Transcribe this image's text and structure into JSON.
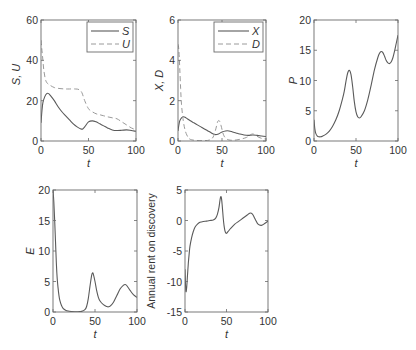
{
  "chart_data": [
    {
      "id": "su",
      "type": "line",
      "title": "",
      "xlabel": "t",
      "ylabel": "S, U",
      "xlim": [
        0,
        100
      ],
      "ylim": [
        0,
        60
      ],
      "xticks": [
        0,
        50,
        100
      ],
      "yticks": [
        0,
        20,
        40,
        60
      ],
      "grid": false,
      "legend_position": "upper right",
      "box": {
        "left": 41,
        "top": 20,
        "right": 136,
        "bottom": 141
      },
      "legend": {
        "left": 87,
        "top": 22,
        "right": 133,
        "bottom": 52
      },
      "series": [
        {
          "name": "S",
          "style": "solid",
          "x": [
            0,
            1,
            2,
            4,
            6,
            8,
            10,
            14,
            18,
            22,
            26,
            30,
            34,
            38,
            42,
            44,
            46,
            50,
            54,
            58,
            62,
            66,
            70,
            75,
            80,
            85,
            90,
            95,
            100
          ],
          "y": [
            9,
            15,
            19,
            22,
            23.5,
            23.5,
            22.5,
            20,
            17,
            14.5,
            12.5,
            10.5,
            8.5,
            7,
            6,
            6,
            7,
            9.5,
            10,
            9.5,
            8.5,
            7.5,
            6.5,
            5.5,
            5.2,
            5.3,
            5.5,
            5.2,
            4.8
          ]
        },
        {
          "name": "U",
          "style": "dashed",
          "x": [
            0,
            1,
            2,
            3,
            5,
            8,
            10,
            14,
            20,
            26,
            30,
            36,
            40,
            43,
            46,
            50,
            54,
            58,
            62,
            66,
            70,
            75,
            80,
            85,
            90,
            95,
            100
          ],
          "y": [
            50,
            45,
            40,
            35,
            30,
            28,
            27.5,
            26.5,
            26,
            25.8,
            25.8,
            25.8,
            25.5,
            24,
            20,
            16,
            14.5,
            13.5,
            13,
            12.5,
            12,
            11.5,
            11,
            9.5,
            8,
            6.5,
            5.5
          ]
        }
      ]
    },
    {
      "id": "xd",
      "type": "line",
      "title": "",
      "xlabel": "t",
      "ylabel": "X, D",
      "xlim": [
        0,
        100
      ],
      "ylim": [
        0,
        6
      ],
      "xticks": [
        0,
        50,
        100
      ],
      "yticks": [
        0,
        2,
        4,
        6
      ],
      "grid": false,
      "legend_position": "upper right",
      "box": {
        "left": 178,
        "top": 20,
        "right": 266,
        "bottom": 141
      },
      "legend": {
        "left": 214,
        "top": 22,
        "right": 263,
        "bottom": 52
      },
      "series": [
        {
          "name": "X",
          "style": "solid",
          "x": [
            0,
            1,
            2,
            4,
            6,
            8,
            10,
            14,
            18,
            22,
            26,
            30,
            34,
            38,
            42,
            46,
            50,
            54,
            58,
            62,
            66,
            70,
            75,
            80,
            85,
            90,
            95,
            100
          ],
          "y": [
            0.5,
            0.8,
            1.0,
            1.15,
            1.2,
            1.18,
            1.12,
            1.0,
            0.9,
            0.8,
            0.7,
            0.6,
            0.5,
            0.4,
            0.32,
            0.35,
            0.45,
            0.5,
            0.5,
            0.45,
            0.4,
            0.35,
            0.3,
            0.28,
            0.3,
            0.28,
            0.25,
            0.22
          ]
        },
        {
          "name": "D",
          "style": "dashed",
          "x": [
            0,
            1,
            2,
            3,
            4,
            6,
            8,
            10,
            12,
            14,
            18,
            24,
            30,
            36,
            40,
            43,
            45,
            47,
            49,
            51,
            53,
            56,
            60,
            66,
            72,
            78,
            82,
            85,
            88,
            92,
            96,
            100
          ],
          "y": [
            4.8,
            4.5,
            3.6,
            2.6,
            1.8,
            1.0,
            0.55,
            0.3,
            0.15,
            0.08,
            0.04,
            0.02,
            0.02,
            0.05,
            0.2,
            0.6,
            0.95,
            1.0,
            0.75,
            0.4,
            0.2,
            0.08,
            0.04,
            0.05,
            0.1,
            0.18,
            0.3,
            0.35,
            0.28,
            0.18,
            0.12,
            0.1
          ]
        }
      ]
    },
    {
      "id": "p",
      "type": "line",
      "title": "",
      "xlabel": "t",
      "ylabel": "P",
      "xlim": [
        0,
        100
      ],
      "ylim": [
        0,
        20
      ],
      "xticks": [
        0,
        50,
        100
      ],
      "yticks": [
        0,
        5,
        10,
        15,
        20
      ],
      "grid": false,
      "legend_position": "none",
      "box": {
        "left": 314,
        "top": 20,
        "right": 398,
        "bottom": 141
      },
      "series": [
        {
          "name": "P",
          "style": "solid",
          "x": [
            0,
            1,
            2,
            4,
            6,
            8,
            10,
            14,
            18,
            22,
            26,
            30,
            34,
            36,
            38,
            40,
            42,
            44,
            46,
            48,
            50,
            52,
            54,
            56,
            60,
            64,
            68,
            72,
            76,
            78,
            80,
            82,
            84,
            86,
            88,
            90,
            92,
            94,
            96,
            98,
            100
          ],
          "y": [
            3.5,
            2,
            1.3,
            0.8,
            0.7,
            0.7,
            0.8,
            1.1,
            1.6,
            2.4,
            3.5,
            5,
            7,
            8.2,
            9.8,
            11.2,
            11.7,
            11,
            9,
            6.5,
            4.8,
            4.0,
            3.8,
            4.0,
            5.0,
            6.8,
            9.2,
            11.8,
            13.8,
            14.5,
            14.8,
            14.6,
            14.0,
            13.3,
            12.9,
            12.8,
            13.1,
            13.8,
            14.9,
            16.2,
            17.5
          ]
        }
      ]
    },
    {
      "id": "e",
      "type": "line",
      "title": "",
      "xlabel": "t",
      "ylabel": "E",
      "xlim": [
        0,
        100
      ],
      "ylim": [
        0,
        20
      ],
      "xticks": [
        0,
        50,
        100
      ],
      "yticks": [
        0,
        5,
        10,
        15,
        20
      ],
      "grid": false,
      "legend_position": "none",
      "box": {
        "left": 53,
        "top": 190,
        "right": 137,
        "bottom": 312
      },
      "series": [
        {
          "name": "E",
          "style": "solid",
          "x": [
            0,
            1,
            2,
            3,
            4,
            5,
            6,
            7,
            8,
            10,
            12,
            15,
            18,
            22,
            26,
            30,
            34,
            38,
            40,
            42,
            44,
            46,
            47,
            48,
            50,
            52,
            54,
            56,
            60,
            64,
            66,
            68,
            72,
            76,
            80,
            84,
            86,
            88,
            92,
            96,
            100
          ],
          "y": [
            20,
            18,
            15,
            11.5,
            8,
            5.5,
            4,
            2.8,
            2,
            1.1,
            0.6,
            0.3,
            0.15,
            0.08,
            0.05,
            0.05,
            0.1,
            0.4,
            0.9,
            2.2,
            4.2,
            6.0,
            6.4,
            6.2,
            5.0,
            3.5,
            2.4,
            1.8,
            1.2,
            0.9,
            0.85,
            0.95,
            1.6,
            2.7,
            3.8,
            4.4,
            4.5,
            4.3,
            3.5,
            2.8,
            2.4
          ]
        }
      ]
    },
    {
      "id": "rent",
      "type": "line",
      "title": "",
      "xlabel": "t",
      "ylabel": "Annual rent on discovery",
      "xlim": [
        0,
        100
      ],
      "ylim": [
        -15,
        5
      ],
      "xticks": [
        0,
        50,
        100
      ],
      "yticks": [
        -15,
        -10,
        -5,
        0,
        5
      ],
      "grid": false,
      "legend_position": "none",
      "box": {
        "left": 185,
        "top": 190,
        "right": 268,
        "bottom": 312
      },
      "series": [
        {
          "name": "Annual rent on discovery",
          "style": "solid",
          "x": [
            0,
            1,
            2,
            3,
            4,
            5,
            6,
            8,
            10,
            12,
            15,
            18,
            22,
            26,
            30,
            34,
            37,
            39,
            41,
            42,
            43,
            44,
            45,
            46,
            47,
            48,
            49,
            50,
            52,
            55,
            60,
            65,
            70,
            75,
            78,
            80,
            82,
            85,
            88,
            92,
            96,
            100
          ],
          "y": [
            -8,
            -11.5,
            -11,
            -9,
            -7,
            -5.5,
            -4.2,
            -2.8,
            -1.8,
            -1.1,
            -0.6,
            -0.3,
            -0.15,
            -0.1,
            0.0,
            0.1,
            0.4,
            1.0,
            2.2,
            3.2,
            3.9,
            3.6,
            2.2,
            0.5,
            -0.8,
            -1.6,
            -2.0,
            -2.1,
            -1.8,
            -1.3,
            -0.6,
            -0.1,
            0.4,
            0.9,
            1.2,
            1.2,
            0.9,
            0.1,
            -0.6,
            -0.8,
            -0.5,
            -0.1
          ]
        }
      ]
    }
  ],
  "labels": {
    "su": {
      "ylabel": "S, U",
      "xlabel": "t",
      "legend": [
        "S",
        "U"
      ]
    },
    "xd": {
      "ylabel": "X, D",
      "xlabel": "t",
      "legend": [
        "X",
        "D"
      ]
    },
    "p": {
      "ylabel": "P",
      "xlabel": "t"
    },
    "e": {
      "ylabel": "E",
      "xlabel": "t"
    },
    "rent": {
      "ylabel": "Annual rent on discovery",
      "xlabel": "t"
    }
  }
}
